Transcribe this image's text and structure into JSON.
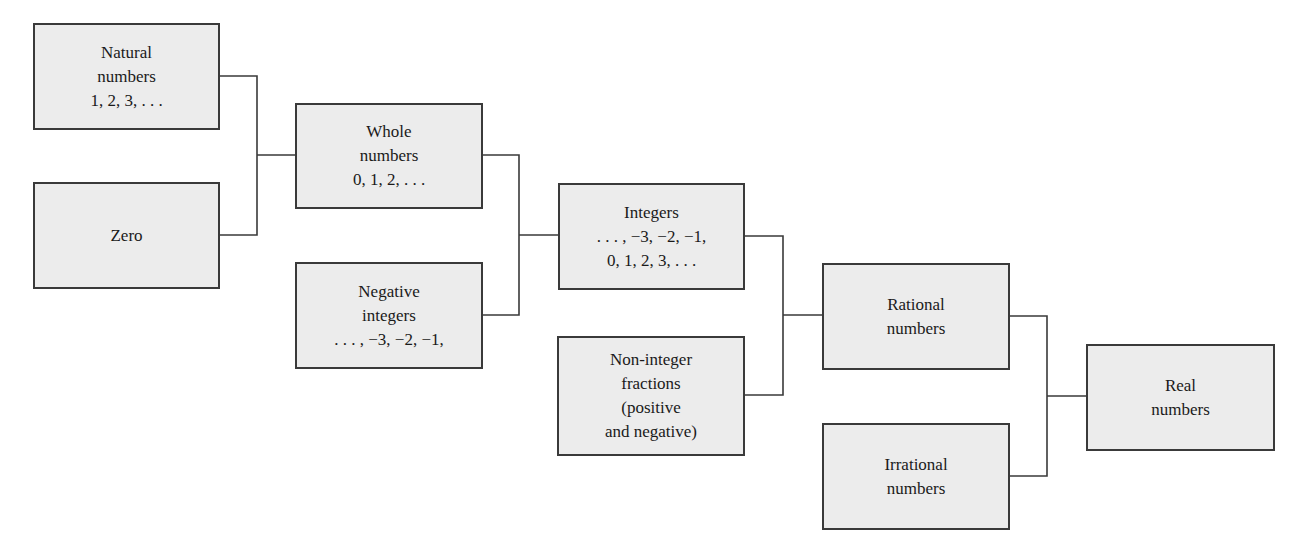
{
  "diagram": {
    "type": "hierarchy",
    "nodes": {
      "natural": {
        "lines": [
          "Natural",
          "numbers",
          "1, 2, 3, . . ."
        ]
      },
      "zero": {
        "lines": [
          "Zero"
        ]
      },
      "whole": {
        "lines": [
          "Whole",
          "numbers",
          "0, 1, 2, . . ."
        ]
      },
      "negative": {
        "lines": [
          "Negative",
          "integers",
          ". . . , −3, −2, −1,"
        ]
      },
      "integers": {
        "lines": [
          "Integers",
          ". . . , −3, −2, −1,",
          "0, 1, 2, 3, . . ."
        ]
      },
      "noninteger": {
        "lines": [
          "Non-integer",
          "fractions",
          "(positive",
          "and negative)"
        ]
      },
      "rational": {
        "lines": [
          "Rational",
          "numbers"
        ]
      },
      "irrational": {
        "lines": [
          "Irrational",
          "numbers"
        ]
      },
      "real": {
        "lines": [
          "Real",
          "numbers"
        ]
      }
    },
    "edges": [
      {
        "from": [
          "natural",
          "zero"
        ],
        "to": "whole"
      },
      {
        "from": [
          "whole",
          "negative"
        ],
        "to": "integers"
      },
      {
        "from": [
          "integers",
          "noninteger"
        ],
        "to": "rational"
      },
      {
        "from": [
          "rational",
          "irrational"
        ],
        "to": "real"
      }
    ]
  }
}
